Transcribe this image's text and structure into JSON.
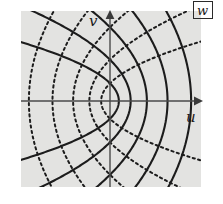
{
  "figure": {
    "name": "parabolic-coordinate-grid",
    "plane_label": "w",
    "axis_labels": {
      "horizontal": "u",
      "vertical": "v"
    },
    "background_color": "#ffffff",
    "plot_background_color": "#e3e3e1",
    "curve_color": "#1c1c1c",
    "axis_color": "#4a4a4a"
  },
  "chart_data": {
    "type": "line",
    "title": "",
    "subtitle": "",
    "xlabel": "u",
    "ylabel": "v",
    "xlim": [
      -3.2,
      3.2
    ],
    "ylim": [
      -2.9,
      2.9
    ],
    "grid": false,
    "legend_position": "none",
    "annotations": [
      {
        "text": "w",
        "x": 2.85,
        "y": 2.72,
        "boxed": true
      },
      {
        "text": "u",
        "x": 2.62,
        "y": -0.38
      },
      {
        "text": "v",
        "x": -0.38,
        "y": 2.56
      }
    ],
    "series": [
      {
        "name": "solid-parabola-a0.30",
        "style": "solid",
        "opens": "left",
        "vertex_u": 0.3,
        "a": 0.3
      },
      {
        "name": "solid-parabola-a0.70",
        "style": "solid",
        "opens": "left",
        "vertex_u": 0.7,
        "a": 0.7
      },
      {
        "name": "solid-parabola-a1.25",
        "style": "solid",
        "opens": "left",
        "vertex_u": 1.25,
        "a": 1.25
      },
      {
        "name": "solid-parabola-a1.95",
        "style": "solid",
        "opens": "left",
        "vertex_u": 1.95,
        "a": 1.95
      },
      {
        "name": "solid-parabola-a2.75",
        "style": "solid",
        "opens": "left",
        "vertex_u": 2.75,
        "a": 2.75
      },
      {
        "name": "dotted-parabola-b0.30",
        "style": "dotted",
        "opens": "right",
        "vertex_u": -0.3,
        "b": 0.3
      },
      {
        "name": "dotted-parabola-b0.70",
        "style": "dotted",
        "opens": "right",
        "vertex_u": -0.7,
        "b": 0.7
      },
      {
        "name": "dotted-parabola-b1.25",
        "style": "dotted",
        "opens": "right",
        "vertex_u": -1.25,
        "b": 1.25
      },
      {
        "name": "dotted-parabola-b1.95",
        "style": "dotted",
        "opens": "right",
        "vertex_u": -1.95,
        "b": 1.95
      },
      {
        "name": "dotted-parabola-b2.75",
        "style": "dotted",
        "opens": "right",
        "vertex_u": -2.75,
        "b": 2.75
      }
    ],
    "axes": [
      {
        "name": "u-axis",
        "from": [
          -3.2,
          0
        ],
        "to": [
          3.05,
          0
        ],
        "arrow": true
      },
      {
        "name": "v-axis",
        "from": [
          0,
          -2.9
        ],
        "to": [
          0,
          2.78
        ],
        "arrow": true
      }
    ]
  }
}
